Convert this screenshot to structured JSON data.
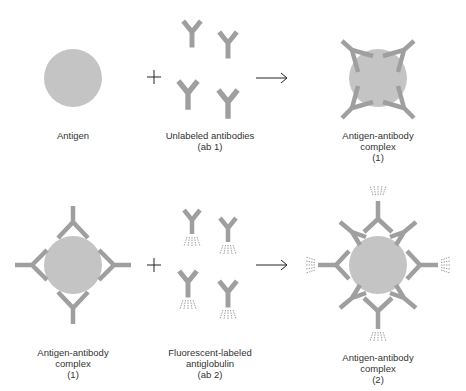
{
  "colors": {
    "antigen": "#c4c4c4",
    "antibody": "#9f9f9f",
    "line": "#222222",
    "fluorescence": "#777777",
    "background": "#ffffff"
  },
  "row1": {
    "antigen_label": [
      "Antigen"
    ],
    "reagent_label": [
      "Unlabeled antibodies",
      "(ab 1)"
    ],
    "product_label": [
      "Antigen-antibody",
      "complex",
      "(1)"
    ],
    "operator_plus": "+",
    "operator_arrow": "→"
  },
  "row2": {
    "complex_label": [
      "Antigen-antibody",
      "complex",
      "(1)"
    ],
    "reagent_label": [
      "Fluorescent-labeled",
      "antiglobulin",
      "(ab 2)"
    ],
    "product_label": [
      "Antigen-antibody",
      "complex",
      "(2)"
    ],
    "operator_plus": "+",
    "operator_arrow": "→"
  }
}
